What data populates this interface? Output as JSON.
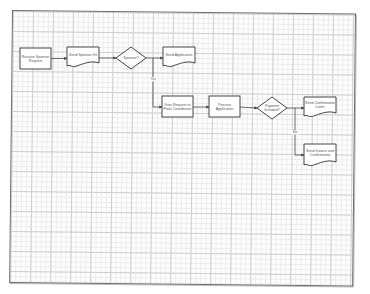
{
  "diagram": {
    "type": "flowchart",
    "nodes": [
      {
        "id": "receive",
        "shape": "process",
        "lines": [
          "Receive Sponsor",
          "Request"
        ]
      },
      {
        "id": "sendkit",
        "shape": "document",
        "lines": [
          "Send Sponsor Kit"
        ]
      },
      {
        "id": "sponsor",
        "shape": "decision",
        "lines": [
          "Sponsor?"
        ]
      },
      {
        "id": "sendapp",
        "shape": "document",
        "lines": [
          "Send Application"
        ]
      },
      {
        "id": "give",
        "shape": "process",
        "lines": [
          "Give Request to",
          "Floor Coordinator"
        ]
      },
      {
        "id": "process",
        "shape": "process",
        "lines": [
          "Process",
          "Application"
        ]
      },
      {
        "id": "payment",
        "shape": "decision",
        "lines": [
          "Payment",
          "Included?"
        ]
      },
      {
        "id": "confirm",
        "shape": "document",
        "lines": [
          "Send Confirmation",
          "Letter"
        ]
      },
      {
        "id": "invoice",
        "shape": "document",
        "lines": [
          "Send Invoice and",
          "Confirmation"
        ]
      }
    ],
    "edges": [
      {
        "from": "receive",
        "to": "sendkit",
        "label": ""
      },
      {
        "from": "sendkit",
        "to": "sponsor",
        "label": ""
      },
      {
        "from": "sponsor",
        "to": "sendapp",
        "label": ""
      },
      {
        "from": "sponsor",
        "to": "give",
        "label": "Yes"
      },
      {
        "from": "give",
        "to": "process",
        "label": ""
      },
      {
        "from": "process",
        "to": "payment",
        "label": ""
      },
      {
        "from": "payment",
        "to": "confirm",
        "label": ""
      },
      {
        "from": "payment",
        "to": "invoice",
        "label": "No"
      }
    ]
  }
}
